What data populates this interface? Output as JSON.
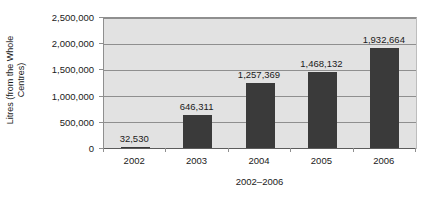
{
  "chart_data": {
    "type": "bar",
    "title": "",
    "xlabel": "2002–2006",
    "ylabel": "Litres (from the Whole Centres)",
    "ylabel_lines": [
      "Litres (from the Whole",
      "Centres)"
    ],
    "categories": [
      "2002",
      "2003",
      "2004",
      "2005",
      "2006"
    ],
    "values": [
      32530,
      646311,
      1257369,
      1468132,
      1932664
    ],
    "value_labels": [
      "32,530",
      "646,311",
      "1,257,369",
      "1,468,132",
      "1,932,664"
    ],
    "ylim": [
      0,
      2500000
    ],
    "ytick_values": [
      0,
      500000,
      1000000,
      1500000,
      2000000,
      2500000
    ],
    "ytick_labels": [
      "0",
      "500,000",
      "1,000,000",
      "1,500,000",
      "2,000,000",
      "2,500,000"
    ],
    "grid": true,
    "legend": false,
    "legend_position": "none",
    "series_name": "Litres",
    "colors": {
      "bar": "#3a3a3a",
      "plot_background": "#e2e2e2",
      "gridline": "#8f8f8f",
      "axis": "#5c5c5c",
      "text": "#1a1a1a",
      "page_background": "#ffffff"
    }
  }
}
